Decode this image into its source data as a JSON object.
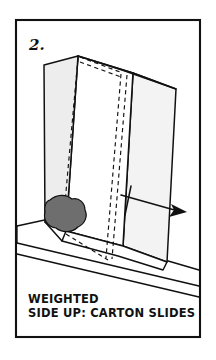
{
  "figure": {
    "step_number": "2.",
    "caption_line1": "WEIGHTED",
    "caption_line2": "SIDE UP: CARTON SLIDES",
    "colors": {
      "ink": "#111111",
      "weight_fill": "#6e6e6e",
      "panel_shade": "#f3f3f3",
      "background": "#ffffff"
    },
    "elements": {
      "frame_label": "figure-border",
      "carton_label": "carton",
      "weight_label": "weight-blob",
      "ramp_label": "inclined-surface",
      "arrow_label": "motion-arrow",
      "hidden_edges_label": "hidden-edge-dashes"
    }
  }
}
